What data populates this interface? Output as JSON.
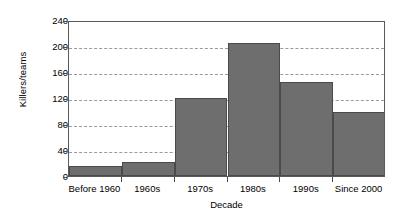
{
  "chart_data": {
    "type": "bar",
    "title": "",
    "xlabel": "Decade",
    "ylabel": "Killers/teams",
    "categories": [
      "Before 1960",
      "1960s",
      "1970s",
      "1980s",
      "1990s",
      "Since 2000"
    ],
    "values": [
      15,
      21,
      120,
      205,
      145,
      98
    ],
    "ylim": [
      0,
      240
    ],
    "yticks": [
      0,
      40,
      80,
      120,
      160,
      200,
      240
    ],
    "ytick_labels": [
      "0",
      "40",
      "80",
      "120",
      "160",
      "200",
      "240"
    ],
    "grid": "horizontal-dashed",
    "legend": "none",
    "bar_style": "contiguous-histogram",
    "colors": {
      "bar_fill": "#6e6e6e",
      "bar_edge": "#4a4a4a",
      "gridline": "#9a9a9a",
      "frame": "#5a5a5a",
      "background": "#ffffff",
      "text": "#000000"
    }
  }
}
